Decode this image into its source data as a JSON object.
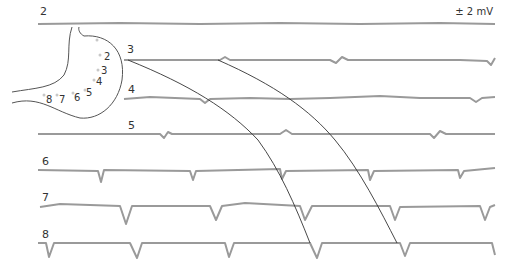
{
  "scale_label": "± 2 mV",
  "traces": [
    {
      "label": "2",
      "y": 20,
      "x0": 38
    },
    {
      "label": "3",
      "y": 60,
      "x0": 124
    },
    {
      "label": "4",
      "y": 99,
      "x0": 124
    },
    {
      "label": "5",
      "y": 134,
      "x0": 38
    },
    {
      "label": "6",
      "y": 170,
      "x0": 38
    },
    {
      "label": "7",
      "y": 206,
      "x0": 38
    },
    {
      "label": "8",
      "y": 243,
      "x0": 38
    }
  ],
  "stomach_electrodes": [
    "2",
    "3",
    "4",
    "5",
    "6",
    "7",
    "8"
  ],
  "colors": {
    "trace": "#9a9a9a",
    "propagation_line": "#333333",
    "outline": "#555555"
  }
}
